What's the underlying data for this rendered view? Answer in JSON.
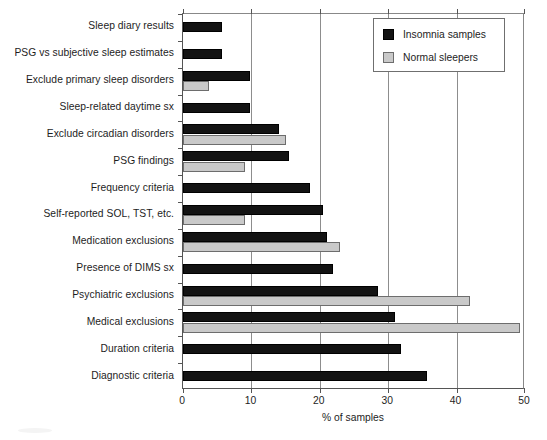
{
  "chart_data": {
    "type": "bar",
    "orientation": "horizontal",
    "title": "",
    "xlabel": "% of samples",
    "ylabel": "",
    "xlim": [
      0,
      50
    ],
    "xticks": [
      0,
      10,
      20,
      30,
      40,
      50
    ],
    "xtick_labels": [
      "0",
      "10",
      "20",
      "30",
      "40",
      "50"
    ],
    "grid": "vertical",
    "legend_position": "top-right",
    "categories": [
      "Sleep diary results",
      "PSG vs subjective sleep estimates",
      "Exclude primary sleep disorders",
      "Sleep-related daytime sx",
      "Exclude circadian disorders",
      "PSG findings",
      "Frequency criteria",
      "Self-reported SOL, TST, etc.",
      "Medication exclusions",
      "Presence of DIMS sx",
      "Psychiatric exclusions",
      "Medical exclusions",
      "Duration criteria",
      "Diagnostic criteria"
    ],
    "series": [
      {
        "name": "Insomnia samples",
        "color": "#131313",
        "values": [
          5.7,
          5.7,
          9.8,
          9.8,
          14.0,
          15.5,
          18.5,
          20.5,
          21.0,
          22.0,
          28.5,
          31.0,
          31.8,
          35.7
        ]
      },
      {
        "name": "Normal sleepers",
        "color": "#c9c9c9",
        "values": [
          0,
          0,
          3.8,
          0,
          15.0,
          9.0,
          0,
          9.0,
          23.0,
          0,
          42.0,
          49.3,
          0,
          0
        ]
      }
    ]
  },
  "legend": {
    "entries": [
      {
        "label": "Insomnia samples",
        "swatch": "black-square-swatch"
      },
      {
        "label": "Normal sleepers",
        "swatch": "gray-square-swatch"
      }
    ]
  }
}
